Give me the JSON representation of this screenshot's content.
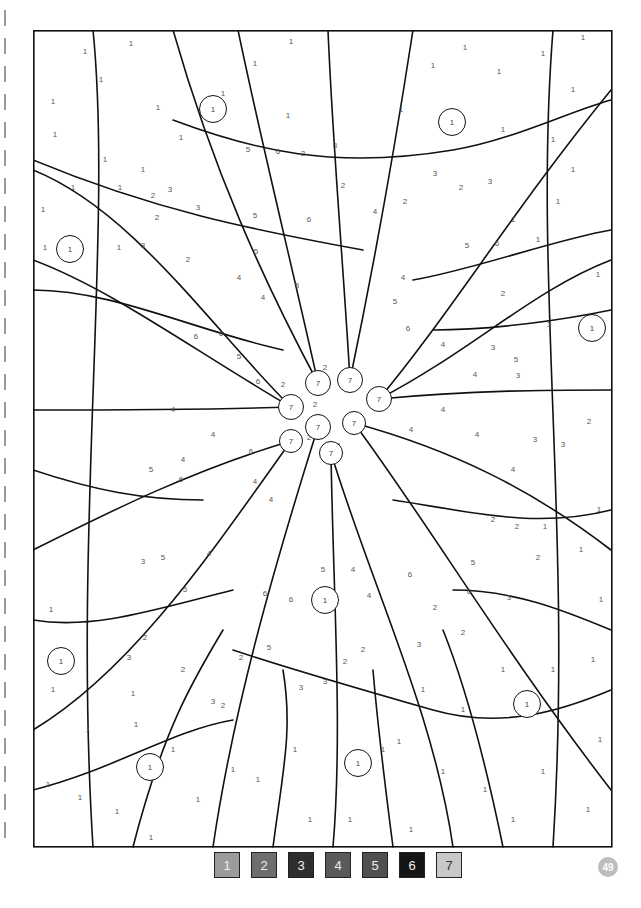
{
  "page": {
    "type": "color-by-number",
    "page_number": "49"
  },
  "legend": [
    {
      "number": "1",
      "color": "#9b9b9b"
    },
    {
      "number": "2",
      "color": "#6e6e6e"
    },
    {
      "number": "3",
      "color": "#2e2e2e"
    },
    {
      "number": "4",
      "color": "#5a5a5a"
    },
    {
      "number": "5",
      "color": "#505050"
    },
    {
      "number": "6",
      "color": "#151515"
    },
    {
      "number": "7",
      "color": "#c8c8c8"
    }
  ],
  "center_circles": [
    {
      "label": "7",
      "x": 285,
      "y": 353,
      "r": 12
    },
    {
      "label": "7",
      "x": 317,
      "y": 350,
      "r": 12
    },
    {
      "label": "7",
      "x": 346,
      "y": 369,
      "r": 12
    },
    {
      "label": "7",
      "x": 258,
      "y": 377,
      "r": 12
    },
    {
      "label": "7",
      "x": 285,
      "y": 397,
      "r": 12
    },
    {
      "label": "7",
      "x": 321,
      "y": 393,
      "r": 11
    },
    {
      "label": "7",
      "x": 258,
      "y": 411,
      "r": 11
    },
    {
      "label": "7",
      "x": 298,
      "y": 423,
      "r": 11
    }
  ],
  "small_circles": [
    {
      "label": "1",
      "x": 180,
      "y": 79
    },
    {
      "label": "1",
      "x": 419,
      "y": 92
    },
    {
      "label": "1",
      "x": 37,
      "y": 219
    },
    {
      "label": "1",
      "x": 559,
      "y": 298
    },
    {
      "label": "1",
      "x": 292,
      "y": 570
    },
    {
      "label": "1",
      "x": 28,
      "y": 631
    },
    {
      "label": "1",
      "x": 494,
      "y": 674
    },
    {
      "label": "1",
      "x": 117,
      "y": 737
    },
    {
      "label": "1",
      "x": 325,
      "y": 733
    }
  ],
  "region_numbers": [
    {
      "n": "1",
      "x": 20,
      "y": 72
    },
    {
      "n": "1",
      "x": 52,
      "y": 22
    },
    {
      "n": "1",
      "x": 98,
      "y": 14
    },
    {
      "n": "1",
      "x": 68,
      "y": 50
    },
    {
      "n": "1",
      "x": 22,
      "y": 105
    },
    {
      "n": "1",
      "x": 72,
      "y": 130
    },
    {
      "n": "1",
      "x": 125,
      "y": 78
    },
    {
      "n": "1",
      "x": 40,
      "y": 158
    },
    {
      "n": "1",
      "x": 110,
      "y": 140
    },
    {
      "n": "1",
      "x": 148,
      "y": 108
    },
    {
      "n": "1",
      "x": 10,
      "y": 180
    },
    {
      "n": "1",
      "x": 87,
      "y": 158
    },
    {
      "n": "1",
      "x": 12,
      "y": 218
    },
    {
      "n": "1",
      "x": 86,
      "y": 218
    },
    {
      "n": "1",
      "x": 258,
      "y": 12
    },
    {
      "n": "1",
      "x": 222,
      "y": 34
    },
    {
      "n": "1",
      "x": 190,
      "y": 64
    },
    {
      "n": "1",
      "x": 255,
      "y": 86
    },
    {
      "n": "1",
      "x": 368,
      "y": 80
    },
    {
      "n": "1",
      "x": 400,
      "y": 36
    },
    {
      "n": "1",
      "x": 432,
      "y": 18
    },
    {
      "n": "1",
      "x": 466,
      "y": 42
    },
    {
      "n": "1",
      "x": 510,
      "y": 24
    },
    {
      "n": "1",
      "x": 550,
      "y": 8
    },
    {
      "n": "1",
      "x": 540,
      "y": 60
    },
    {
      "n": "1",
      "x": 470,
      "y": 100
    },
    {
      "n": "1",
      "x": 520,
      "y": 110
    },
    {
      "n": "1",
      "x": 540,
      "y": 140
    },
    {
      "n": "1",
      "x": 525,
      "y": 172
    },
    {
      "n": "1",
      "x": 480,
      "y": 190
    },
    {
      "n": "1",
      "x": 505,
      "y": 210
    },
    {
      "n": "1",
      "x": 565,
      "y": 245
    },
    {
      "n": "2",
      "x": 120,
      "y": 166
    },
    {
      "n": "3",
      "x": 137,
      "y": 160
    },
    {
      "n": "3",
      "x": 165,
      "y": 178
    },
    {
      "n": "2",
      "x": 124,
      "y": 188
    },
    {
      "n": "2",
      "x": 155,
      "y": 230
    },
    {
      "n": "3",
      "x": 110,
      "y": 216
    },
    {
      "n": "5",
      "x": 215,
      "y": 120
    },
    {
      "n": "6",
      "x": 245,
      "y": 122
    },
    {
      "n": "2",
      "x": 270,
      "y": 124
    },
    {
      "n": "3",
      "x": 302,
      "y": 116
    },
    {
      "n": "2",
      "x": 310,
      "y": 156
    },
    {
      "n": "5",
      "x": 222,
      "y": 186
    },
    {
      "n": "6",
      "x": 276,
      "y": 190
    },
    {
      "n": "4",
      "x": 342,
      "y": 182
    },
    {
      "n": "2",
      "x": 372,
      "y": 172
    },
    {
      "n": "3",
      "x": 402,
      "y": 144
    },
    {
      "n": "2",
      "x": 428,
      "y": 158
    },
    {
      "n": "3",
      "x": 457,
      "y": 152
    },
    {
      "n": "5",
      "x": 434,
      "y": 216
    },
    {
      "n": "6",
      "x": 464,
      "y": 214
    },
    {
      "n": "4",
      "x": 370,
      "y": 248
    },
    {
      "n": "5",
      "x": 362,
      "y": 272
    },
    {
      "n": "6",
      "x": 375,
      "y": 299
    },
    {
      "n": "4",
      "x": 410,
      "y": 315
    },
    {
      "n": "5",
      "x": 223,
      "y": 222
    },
    {
      "n": "5",
      "x": 264,
      "y": 256
    },
    {
      "n": "4",
      "x": 206,
      "y": 248
    },
    {
      "n": "4",
      "x": 230,
      "y": 268
    },
    {
      "n": "6",
      "x": 188,
      "y": 304
    },
    {
      "n": "6",
      "x": 163,
      "y": 307
    },
    {
      "n": "5",
      "x": 206,
      "y": 327
    },
    {
      "n": "6",
      "x": 225,
      "y": 352
    },
    {
      "n": "2",
      "x": 250,
      "y": 355
    },
    {
      "n": "2",
      "x": 282,
      "y": 375
    },
    {
      "n": "2",
      "x": 292,
      "y": 338
    },
    {
      "n": "2",
      "x": 321,
      "y": 349
    },
    {
      "n": "2",
      "x": 340,
      "y": 372
    },
    {
      "n": "2",
      "x": 276,
      "y": 408
    },
    {
      "n": "2",
      "x": 305,
      "y": 416
    },
    {
      "n": "4",
      "x": 378,
      "y": 400
    },
    {
      "n": "4",
      "x": 410,
      "y": 380
    },
    {
      "n": "4",
      "x": 444,
      "y": 405
    },
    {
      "n": "2",
      "x": 556,
      "y": 392
    },
    {
      "n": "3",
      "x": 530,
      "y": 415
    },
    {
      "n": "4",
      "x": 480,
      "y": 440
    },
    {
      "n": "3",
      "x": 502,
      "y": 410
    },
    {
      "n": "4",
      "x": 442,
      "y": 345
    },
    {
      "n": "5",
      "x": 483,
      "y": 330
    },
    {
      "n": "3",
      "x": 460,
      "y": 318
    },
    {
      "n": "2",
      "x": 470,
      "y": 264
    },
    {
      "n": "3",
      "x": 516,
      "y": 295
    },
    {
      "n": "3",
      "x": 485,
      "y": 346
    },
    {
      "n": "4",
      "x": 140,
      "y": 380
    },
    {
      "n": "4",
      "x": 180,
      "y": 405
    },
    {
      "n": "4",
      "x": 150,
      "y": 430
    },
    {
      "n": "6",
      "x": 148,
      "y": 450
    },
    {
      "n": "5",
      "x": 118,
      "y": 440
    },
    {
      "n": "6",
      "x": 218,
      "y": 422
    },
    {
      "n": "4",
      "x": 222,
      "y": 452
    },
    {
      "n": "4",
      "x": 238,
      "y": 470
    },
    {
      "n": "5",
      "x": 130,
      "y": 528
    },
    {
      "n": "4",
      "x": 176,
      "y": 524
    },
    {
      "n": "3",
      "x": 110,
      "y": 532
    },
    {
      "n": "5",
      "x": 152,
      "y": 560
    },
    {
      "n": "6",
      "x": 232,
      "y": 564
    },
    {
      "n": "6",
      "x": 258,
      "y": 570
    },
    {
      "n": "5",
      "x": 290,
      "y": 540
    },
    {
      "n": "4",
      "x": 320,
      "y": 540
    },
    {
      "n": "4",
      "x": 336,
      "y": 566
    },
    {
      "n": "6",
      "x": 377,
      "y": 545
    },
    {
      "n": "5",
      "x": 440,
      "y": 533
    },
    {
      "n": "6",
      "x": 436,
      "y": 562
    },
    {
      "n": "3",
      "x": 476,
      "y": 568
    },
    {
      "n": "2",
      "x": 402,
      "y": 578
    },
    {
      "n": "2",
      "x": 430,
      "y": 603
    },
    {
      "n": "3",
      "x": 386,
      "y": 615
    },
    {
      "n": "2",
      "x": 460,
      "y": 490
    },
    {
      "n": "2",
      "x": 484,
      "y": 497
    },
    {
      "n": "1",
      "x": 512,
      "y": 497
    },
    {
      "n": "2",
      "x": 505,
      "y": 528
    },
    {
      "n": "2",
      "x": 330,
      "y": 620
    },
    {
      "n": "3",
      "x": 292,
      "y": 652
    },
    {
      "n": "2",
      "x": 312,
      "y": 632
    },
    {
      "n": "3",
      "x": 268,
      "y": 658
    },
    {
      "n": "2",
      "x": 208,
      "y": 628
    },
    {
      "n": "5",
      "x": 236,
      "y": 618
    },
    {
      "n": "2",
      "x": 112,
      "y": 608
    },
    {
      "n": "3",
      "x": 96,
      "y": 628
    },
    {
      "n": "2",
      "x": 150,
      "y": 640
    },
    {
      "n": "3",
      "x": 180,
      "y": 672
    },
    {
      "n": "2",
      "x": 190,
      "y": 676
    },
    {
      "n": "1",
      "x": 100,
      "y": 664
    },
    {
      "n": "1",
      "x": 18,
      "y": 580
    },
    {
      "n": "1",
      "x": 20,
      "y": 660
    },
    {
      "n": "1",
      "x": 55,
      "y": 700
    },
    {
      "n": "1",
      "x": 103,
      "y": 695
    },
    {
      "n": "1",
      "x": 15,
      "y": 755
    },
    {
      "n": "1",
      "x": 47,
      "y": 768
    },
    {
      "n": "1",
      "x": 84,
      "y": 782
    },
    {
      "n": "1",
      "x": 118,
      "y": 808
    },
    {
      "n": "1",
      "x": 140,
      "y": 720
    },
    {
      "n": "1",
      "x": 165,
      "y": 770
    },
    {
      "n": "1",
      "x": 200,
      "y": 740
    },
    {
      "n": "1",
      "x": 225,
      "y": 750
    },
    {
      "n": "1",
      "x": 262,
      "y": 720
    },
    {
      "n": "1",
      "x": 277,
      "y": 790
    },
    {
      "n": "1",
      "x": 317,
      "y": 790
    },
    {
      "n": "1",
      "x": 350,
      "y": 720
    },
    {
      "n": "1",
      "x": 378,
      "y": 800
    },
    {
      "n": "1",
      "x": 410,
      "y": 742
    },
    {
      "n": "1",
      "x": 452,
      "y": 760
    },
    {
      "n": "1",
      "x": 480,
      "y": 790
    },
    {
      "n": "1",
      "x": 510,
      "y": 742
    },
    {
      "n": "1",
      "x": 555,
      "y": 780
    },
    {
      "n": "1",
      "x": 567,
      "y": 710
    },
    {
      "n": "1",
      "x": 560,
      "y": 630
    },
    {
      "n": "1",
      "x": 568,
      "y": 570
    },
    {
      "n": "1",
      "x": 566,
      "y": 480
    },
    {
      "n": "1",
      "x": 548,
      "y": 520
    },
    {
      "n": "1",
      "x": 520,
      "y": 640
    },
    {
      "n": "1",
      "x": 470,
      "y": 640
    },
    {
      "n": "1",
      "x": 430,
      "y": 680
    },
    {
      "n": "1",
      "x": 390,
      "y": 660
    },
    {
      "n": "1",
      "x": 366,
      "y": 712
    }
  ]
}
